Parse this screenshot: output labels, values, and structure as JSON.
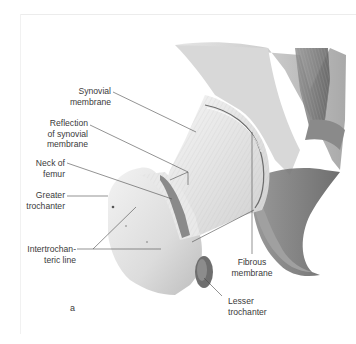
{
  "figure": {
    "panel_letter": "a",
    "labels": [
      {
        "id": "synovial-membrane",
        "line1": "Synovial",
        "line2": "membrane"
      },
      {
        "id": "reflection-synovial",
        "line1": "Reflection",
        "line2": "of synovial",
        "line3": "membrane"
      },
      {
        "id": "neck-of-femur",
        "line1": "Neck of",
        "line2": "femur"
      },
      {
        "id": "greater-trochanter",
        "line1": "Greater",
        "line2": "trochanter"
      },
      {
        "id": "intertrochanteric-line",
        "line1": "Intertrochan-",
        "line2": "teric line"
      },
      {
        "id": "fibrous-membrane",
        "line1": "Fibrous",
        "line2": "membrane"
      },
      {
        "id": "lesser-trochanter",
        "line1": "Lesser",
        "line2": "trochanter"
      }
    ]
  }
}
